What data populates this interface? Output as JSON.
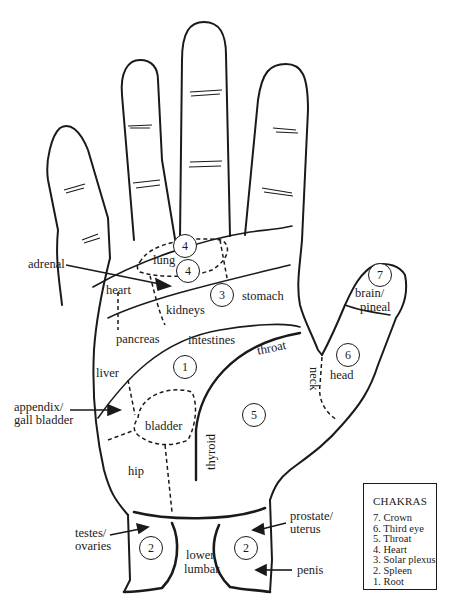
{
  "diagram": {
    "type": "palm reflexology / chakra map",
    "stroke_color": "#1a1a1a",
    "background": "#ffffff"
  },
  "regions": {
    "lung": "lung",
    "heart": "heart",
    "kidneys": "kidneys",
    "stomach": "stomach",
    "pancreas": "pancreas",
    "intestines": "intestines",
    "throat": "throat",
    "liver": "liver",
    "bladder": "bladder",
    "thyroid": "thyroid",
    "hip": "hip",
    "neck": "neck",
    "head": "head",
    "brain_line1": "brain/",
    "brain_line2": "pineal",
    "lower_line1": "lower",
    "lower_line2": "lumbar"
  },
  "callouts": {
    "adrenal": "adrenal",
    "appendix_line1": "appendix/",
    "appendix_line2": "gall bladder",
    "testes_line1": "testes/",
    "testes_line2": "ovaries",
    "prostate_line1": "prostate/",
    "prostate_line2": "uterus",
    "penis": "penis"
  },
  "chakra_markers": [
    {
      "number": "4",
      "location": "upper palm (lung)"
    },
    {
      "number": "4",
      "location": "heart"
    },
    {
      "number": "3",
      "location": "solar plexus / stomach"
    },
    {
      "number": "7",
      "location": "thumb tip"
    },
    {
      "number": "6",
      "location": "thumb base"
    },
    {
      "number": "1",
      "location": "center palm"
    },
    {
      "number": "5",
      "location": "thenar"
    },
    {
      "number": "2",
      "location": "left wrist"
    },
    {
      "number": "2",
      "location": "right wrist"
    }
  ],
  "legend": {
    "title": "CHAKRAS",
    "items": [
      "7.  Crown",
      "6.  Third eye",
      "5.  Throat",
      "4.  Heart",
      "3.  Solar plexus",
      "2.  Spleen",
      "1.  Root"
    ]
  }
}
